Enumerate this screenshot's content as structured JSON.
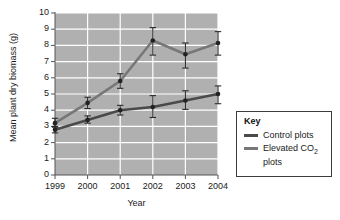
{
  "chart_data": {
    "type": "line",
    "title": "",
    "xlabel": "Year",
    "ylabel": "Mean plant dry biomass (g)",
    "categories": [
      "1999",
      "2000",
      "2001",
      "2002",
      "2003",
      "2004"
    ],
    "x": [
      1999,
      2000,
      2001,
      2002,
      2003,
      2004
    ],
    "xlim": [
      1999,
      2004
    ],
    "ylim": [
      0,
      10
    ],
    "yticks": [
      0,
      1,
      2,
      3,
      4,
      5,
      6,
      7,
      8,
      9,
      10
    ],
    "ytick_labels": [
      "0",
      "1",
      "2",
      "3",
      "4",
      "5",
      "6",
      "7",
      "8",
      "9",
      "10"
    ],
    "xtick_labels": [
      "1999",
      "2000",
      "2001",
      "2002",
      "2003",
      "2004"
    ],
    "grid": "both-white-on-gray",
    "plot_background": "#b0b0b0",
    "gridline_color": "#ffffff",
    "legend_position": "right-outside",
    "error_bars": true,
    "series": [
      {
        "name": "Control plots",
        "color": "#4a4a4a",
        "values": [
          2.8,
          3.4,
          4.0,
          4.2,
          4.6,
          5.0
        ],
        "err_low": [
          2.6,
          3.2,
          3.7,
          3.55,
          4.05,
          4.4
        ],
        "err_high": [
          3.0,
          3.65,
          4.3,
          4.9,
          5.2,
          5.5
        ]
      },
      {
        "name": "Elevated CO2 plots",
        "color": "#777777",
        "values": [
          3.2,
          4.45,
          5.8,
          8.3,
          7.45,
          8.15
        ],
        "err_low": [
          2.95,
          4.1,
          5.35,
          7.4,
          6.6,
          7.4
        ],
        "err_high": [
          3.5,
          4.8,
          6.25,
          9.1,
          8.15,
          8.85
        ]
      }
    ]
  },
  "legend": {
    "title": "Key",
    "entries": [
      {
        "label": "Control plots",
        "label_prefix": "Control plots",
        "label_sub": "",
        "label_suffix": "",
        "color": "#4a4a4a"
      },
      {
        "label": "Elevated CO2 plots",
        "label_prefix": "Elevated CO",
        "label_sub": "2",
        "label_suffix": " plots",
        "color": "#777777"
      }
    ]
  }
}
